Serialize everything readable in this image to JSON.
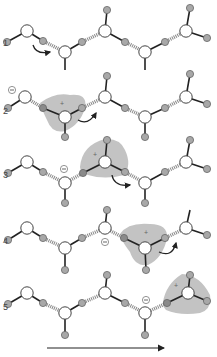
{
  "colors": {
    "oxygen_fill": "#ffffff",
    "oxygen_stroke": "#444444",
    "hydrogen_fill": "#a8a8a8",
    "hydrogen_stroke": "#666666",
    "highlight": "#b9b9b9",
    "bond": "#222222",
    "hbond": "#888888",
    "arrow": "#222222"
  },
  "steps": [
    {
      "label": "1",
      "label_y": 45
    },
    {
      "label": "2",
      "label_y": 113
    },
    {
      "label": "3",
      "label_y": 177
    },
    {
      "label": "4",
      "label_y": 243
    },
    {
      "label": "5",
      "label_y": 309
    }
  ],
  "charge_symbols": {
    "plus": "+",
    "minus": "−"
  },
  "direction_arrow": {
    "x1": 47,
    "x2": 166,
    "y": 348
  }
}
